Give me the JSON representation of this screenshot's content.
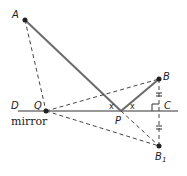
{
  "diagram": {
    "mirror_label": "mirror",
    "points": {
      "A": "A",
      "B": "B",
      "B1": "B",
      "B1_sub": "1",
      "C": "C",
      "D": "D",
      "P": "P",
      "Q": "Q"
    },
    "angle_labels": [
      "x",
      "x"
    ],
    "colors": {
      "solid": "#6b6b6b",
      "dashed": "#444444",
      "point": "#222222"
    }
  }
}
